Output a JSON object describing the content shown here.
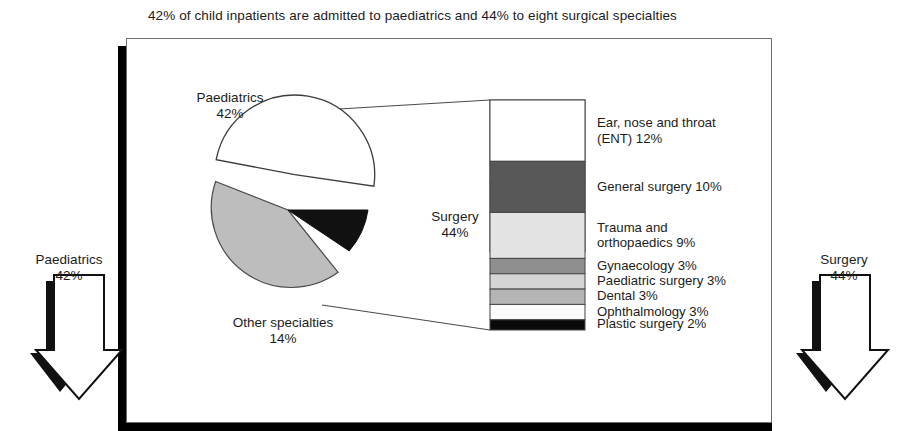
{
  "title": "42% of child inpatients are admitted to paediatrics and 44% to eight surgical specialties",
  "pie": {
    "slices": [
      {
        "label": "Paediatrics",
        "value_label": "42%",
        "value": 42,
        "color": "#bdbdbd"
      },
      {
        "label": "Surgery",
        "value_label": "44%",
        "value": 44,
        "color": "#ffffff"
      },
      {
        "label": "Other specialties",
        "value_label": "14%",
        "value": 14,
        "color": "#111111"
      }
    ]
  },
  "arrows": {
    "left": {
      "label": "Paediatrics",
      "value_label": "42%"
    },
    "right": {
      "label": "Surgery",
      "value_label": "44%"
    }
  },
  "legend": [
    {
      "line1": "Ear, nose and throat",
      "line2": "(ENT) 12%",
      "value": 12,
      "color": "#ffffff"
    },
    {
      "line1": "General surgery 10%",
      "line2": "",
      "value": 10,
      "color": "#585858"
    },
    {
      "line1": "Trauma and",
      "line2": "orthopaedics 9%",
      "value": 9,
      "color": "#e3e3e3"
    },
    {
      "line1": "Gynaecology 3%",
      "line2": "",
      "value": 3,
      "color": "#8f8f8f"
    },
    {
      "line1": "Paediatric surgery 3%",
      "line2": "",
      "value": 3,
      "color": "#d5d5d5"
    },
    {
      "line1": "Dental 3%",
      "line2": "",
      "value": 3,
      "color": "#b5b5b5"
    },
    {
      "line1": "Ophthalmology 3%",
      "line2": "",
      "value": 3,
      "color": "#fbfbfb"
    },
    {
      "line1": "Plastic surgery 2%",
      "line2": "",
      "value": 2,
      "color": "#0a0a0a"
    }
  ],
  "chart_data": {
    "type": "pie",
    "title": "42% of child inpatients are admitted to paediatrics and 44% to eight surgical specialties",
    "categories": [
      "Paediatrics",
      "Surgery",
      "Other specialties"
    ],
    "values": [
      42,
      44,
      14
    ],
    "units": "percent",
    "exploded_slice": "Surgery",
    "breakout": {
      "type": "bar",
      "orientation": "stacked-vertical",
      "parent_slice": "Surgery",
      "parent_value": 44,
      "categories": [
        "Ear, nose and throat (ENT)",
        "General surgery",
        "Trauma and orthopaedics",
        "Gynaecology",
        "Paediatric surgery",
        "Dental",
        "Ophthalmology",
        "Plastic surgery"
      ],
      "values": [
        12,
        10,
        9,
        3,
        3,
        3,
        3,
        2
      ],
      "ylabel": "",
      "xlabel": ""
    }
  }
}
